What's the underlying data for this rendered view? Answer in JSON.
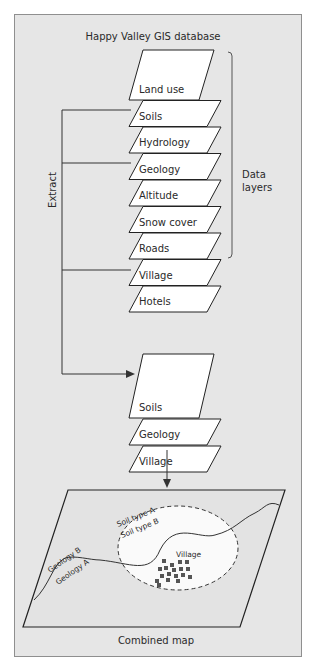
{
  "title": "Happy Valley GIS database",
  "extract_label": "Extract",
  "bracket_label": [
    "Data",
    "layers"
  ],
  "database_layers": [
    {
      "label": "Land use",
      "extracted": false
    },
    {
      "label": "Soils",
      "extracted": true
    },
    {
      "label": "Hydrology",
      "extracted": false
    },
    {
      "label": "Geology",
      "extracted": true
    },
    {
      "label": "Altitude",
      "extracted": false
    },
    {
      "label": "Snow cover",
      "extracted": false
    },
    {
      "label": "Roads",
      "extracted": false
    },
    {
      "label": "Village",
      "extracted": true
    },
    {
      "label": "Hotels",
      "extracted": false
    }
  ],
  "extracted_layers": [
    {
      "label": "Soils"
    },
    {
      "label": "Geology"
    },
    {
      "label": "Village"
    }
  ],
  "map": {
    "caption": "Combined map",
    "soil_boundary_labels": [
      "Soil type A",
      "Soil type B"
    ],
    "geology_boundary_labels": [
      "Geology B",
      "Geology A"
    ],
    "village_label": "Village"
  },
  "colors": {
    "panel_bg": "#e6e6e6",
    "panel_border": "#8f8f8f",
    "layer_fill": "#ffffff",
    "line": "#333333",
    "village_blocks": "#555555"
  }
}
